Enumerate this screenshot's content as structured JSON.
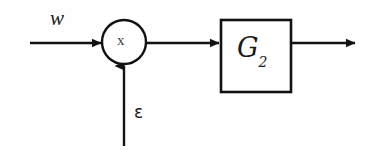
{
  "diagram": {
    "type": "block-diagram",
    "background_color": "#fefefe",
    "stroke_color": "#1a1a1a",
    "nodes": [
      {
        "id": "multiplier",
        "shape": "circle",
        "label": "x",
        "semantic": "multiplication-operator",
        "cx": 124,
        "cy": 42,
        "r": 22
      },
      {
        "id": "gain-block",
        "shape": "rectangle",
        "label": "G",
        "subscript": "2",
        "semantic": "transfer-function-block",
        "x": 221,
        "y": 20,
        "width": 70,
        "height": 72
      }
    ],
    "signals": [
      {
        "id": "input-w",
        "label": "w",
        "from": "external-left",
        "to": "multiplier",
        "direction": "right"
      },
      {
        "id": "input-epsilon",
        "label": "ε",
        "from": "external-bottom",
        "to": "multiplier",
        "direction": "up"
      },
      {
        "id": "multiplier-to-block",
        "label": "",
        "from": "multiplier",
        "to": "gain-block",
        "direction": "right"
      },
      {
        "id": "block-output",
        "label": "",
        "from": "gain-block",
        "to": "external-right",
        "direction": "right"
      }
    ],
    "labels": {
      "input_w": "w",
      "input_epsilon": "ε",
      "multiplier_symbol": "x",
      "block_main": "G",
      "block_subscript": "2"
    }
  }
}
